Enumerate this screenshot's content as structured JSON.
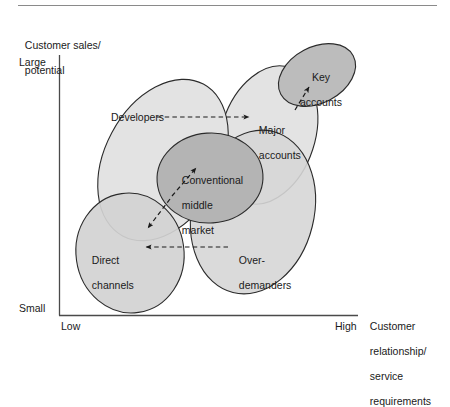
{
  "figure": {
    "top_rule": true,
    "axes": {
      "y_axis_title": "Customer sales/\npotential",
      "y_ticks": [
        "Large",
        "Small"
      ],
      "x_axis_title": "Customer\nrelationship/\nservice\nrequirements",
      "x_ticks": [
        "Low",
        "High"
      ]
    },
    "segments": [
      {
        "id": "developers",
        "label": "Developers",
        "fill": "#e3e3e3"
      },
      {
        "id": "major",
        "label": "Major\naccounts",
        "fill": "#e3e3e3"
      },
      {
        "id": "key",
        "label": "Key\naccounts",
        "fill": "#bcbcbc"
      },
      {
        "id": "conventional",
        "label": "Conventional\nmiddle\nmarket",
        "fill": "#b4b4b4"
      },
      {
        "id": "overdemand",
        "label": "Over-\ndemanders",
        "fill": "#d6d6d6"
      },
      {
        "id": "direct",
        "label": "Direct\nchannels",
        "fill": "#d2d2d2"
      }
    ],
    "labels": {
      "developers": "Developers",
      "major_accounts_line1": "Major",
      "major_accounts_line2": "accounts",
      "key_accounts_line1": "Key",
      "key_accounts_line2": "accounts",
      "conventional_line1": "Conventional",
      "conventional_line2": "middle",
      "conventional_line3": "market",
      "overdemanders_line1": "Over-",
      "overdemanders_line2": "demanders",
      "direct_line1": "Direct",
      "direct_line2": "channels",
      "y_title_line1": "Customer sales/",
      "y_title_line2": "potential",
      "tick_large": "Large",
      "tick_small": "Small",
      "tick_low": "Low",
      "tick_high": "High",
      "x_title_line1": "Customer",
      "x_title_line2": "relationship/",
      "x_title_line3": "service",
      "x_title_line4": "requirements"
    },
    "arrows": [
      {
        "id": "developers-to-major",
        "from": "Developers",
        "to": "Major accounts",
        "style": "dashed"
      },
      {
        "id": "major-to-key",
        "from": "Major accounts",
        "to": "Key accounts",
        "style": "dashed"
      },
      {
        "id": "overdemanders-to-direct",
        "from": "Over-demanders",
        "to": "Direct channels",
        "style": "dashed"
      },
      {
        "id": "middle-two-way",
        "from": "Direct channels",
        "to": "Conventional middle market",
        "style": "dashed-double"
      }
    ],
    "colors": {
      "line": "#2b2b2b",
      "rule": "#8a8a8a",
      "axis": "#4a4a4a"
    }
  }
}
